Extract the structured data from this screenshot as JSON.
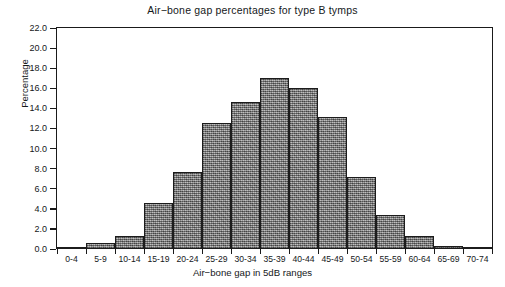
{
  "chart_data": {
    "type": "bar",
    "title": "Air−bone gap percentages for type B tymps",
    "xlabel": "Air−bone gap in 5dB ranges",
    "ylabel": "Percentage",
    "categories": [
      "0-4",
      "5-9",
      "10-14",
      "15-19",
      "20-24",
      "25-29",
      "30-34",
      "35-39",
      "40-44",
      "45-49",
      "50-54",
      "55-59",
      "60-64",
      "65-69",
      "70-74"
    ],
    "values": [
      0.2,
      0.6,
      1.3,
      4.6,
      7.7,
      12.5,
      14.6,
      17.0,
      16.0,
      13.1,
      7.2,
      3.4,
      1.3,
      0.3,
      0.1
    ],
    "ylim": [
      0.0,
      22.0
    ],
    "ytick_labels": [
      "0.0",
      "2.0",
      "4.0",
      "6.0",
      "8.0",
      "10.0",
      "12.0",
      "14.0",
      "16.0",
      "18.0",
      "20.0",
      "22.0"
    ],
    "ytick_values": [
      0.0,
      2.0,
      4.0,
      6.0,
      8.0,
      10.0,
      12.0,
      14.0,
      16.0,
      18.0,
      20.0,
      22.0
    ],
    "grid": false,
    "legend": null,
    "bar_color": "#8d8d8d",
    "bar_edge_color": "#1c1c1c",
    "axis_color": "#1a1a1a",
    "background_color": "#ffffff"
  }
}
